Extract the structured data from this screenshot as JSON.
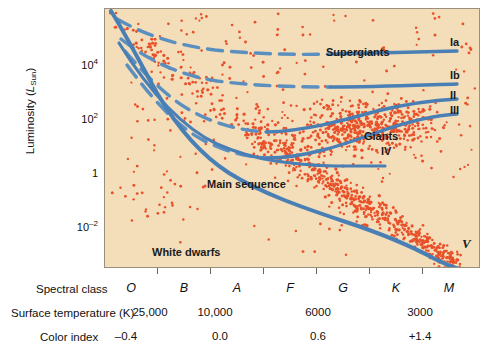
{
  "figure": {
    "type": "hr-diagram",
    "background_color": "#ffffff",
    "plot_background_color": "#f4ddb9",
    "curve_color": "#4a7fb5",
    "star_point_color": "#e8512a"
  },
  "axes": {
    "y": {
      "title_text": "Luminosity (",
      "title_symbol": "L",
      "title_subscript": "Sun",
      "title_close": ")",
      "ticks": [
        {
          "label_mantissa": "10",
          "label_exponent": "4",
          "y_px": 66
        },
        {
          "label_mantissa": "10",
          "label_exponent": "2",
          "y_px": 120
        },
        {
          "label_mantissa": "1",
          "label_exponent": "",
          "y_px": 174
        },
        {
          "label_mantissa": "10",
          "label_exponent": "–2",
          "y_px": 228
        }
      ]
    },
    "x": {
      "rows": [
        {
          "caption": "Spectral class",
          "style": "spectral",
          "values": [
            {
              "text": "O",
              "x_px": 131
            },
            {
              "text": "B",
              "x_px": 184
            },
            {
              "text": "A",
              "x_px": 237
            },
            {
              "text": "F",
              "x_px": 290
            },
            {
              "text": "G",
              "x_px": 343
            },
            {
              "text": "K",
              "x_px": 396
            },
            {
              "text": "M",
              "x_px": 449
            }
          ]
        },
        {
          "caption": "Surface temperature (K)",
          "style": "num",
          "values": [
            {
              "text": "25,000",
              "x_px": 150
            },
            {
              "text": "10,000",
              "x_px": 215
            },
            {
              "text": "6000",
              "x_px": 318
            },
            {
              "text": "3000",
              "x_px": 420
            }
          ]
        },
        {
          "caption": "Color index",
          "style": "num",
          "values": [
            {
              "text": "–0.4",
              "x_px": 126
            },
            {
              "text": "0.0",
              "x_px": 220
            },
            {
              "text": "0.6",
              "x_px": 318
            },
            {
              "text": "+1.4",
              "x_px": 420
            }
          ]
        }
      ],
      "tick_x_px": [
        157,
        210,
        263,
        316,
        369,
        422
      ]
    }
  },
  "annotations": {
    "regions": [
      {
        "text": "Supergiants",
        "x_px": 325,
        "y_px": 46
      },
      {
        "text": "Giants",
        "x_px": 363,
        "y_px": 130
      },
      {
        "text": "Main sequence",
        "x_px": 206,
        "y_px": 178
      },
      {
        "text": "White dwarfs",
        "x_px": 151,
        "y_px": 246
      }
    ],
    "luminosity_classes": [
      {
        "text": "Ia",
        "x_px": 449,
        "y_px": 36
      },
      {
        "text": "Ib",
        "x_px": 449,
        "y_px": 69
      },
      {
        "text": "II",
        "x_px": 449,
        "y_px": 89
      },
      {
        "text": "III",
        "x_px": 449,
        "y_px": 104
      },
      {
        "text": "IV",
        "x_px": 380,
        "y_px": 145
      },
      {
        "text": "V",
        "x_px": 462,
        "y_px": 237
      }
    ]
  },
  "chart_data": {
    "type": "scatter",
    "title": "",
    "xlabel": "Spectral class / Surface temperature (K) / Color index",
    "ylabel": "Luminosity (L_Sun)",
    "grid": false,
    "legend_position": "none",
    "x_axis": {
      "kind": "categorical-spectral",
      "categories": [
        "O",
        "B",
        "A",
        "F",
        "G",
        "K",
        "M"
      ],
      "temperature_K": [
        25000,
        10000,
        null,
        6000,
        null,
        3000,
        null
      ],
      "color_index": [
        -0.4,
        0.0,
        null,
        0.6,
        null,
        1.4,
        null
      ],
      "direction": "decreasing temperature left to right"
    },
    "y_axis": {
      "scale": "log",
      "tick_values": [
        10000,
        100,
        1,
        0.01
      ],
      "tick_labels": [
        "10^4",
        "10^2",
        "1",
        "10^-2"
      ],
      "ylim": [
        0.0005,
        500000
      ]
    },
    "series": [
      {
        "name": "Ia supergiants",
        "type": "line",
        "style": "solid-right-dashed-left",
        "points": [
          [
            0.02,
            200000
          ],
          [
            0.1,
            90000
          ],
          [
            0.22,
            60000
          ],
          [
            0.4,
            48000
          ],
          [
            0.62,
            44000
          ],
          [
            0.8,
            45000
          ],
          [
            1.0,
            47000
          ]
        ]
      },
      {
        "name": "Ib supergiants",
        "type": "line",
        "style": "solid-right-dashed-left",
        "points": [
          [
            0.05,
            90000
          ],
          [
            0.15,
            30000
          ],
          [
            0.3,
            14000
          ],
          [
            0.5,
            10500
          ],
          [
            0.7,
            10000
          ],
          [
            0.85,
            10500
          ],
          [
            1.0,
            11000
          ]
        ]
      },
      {
        "name": "II bright giants",
        "type": "line",
        "style": "solid-right-dashed-left",
        "points": [
          [
            0.08,
            40000
          ],
          [
            0.2,
            6000
          ],
          [
            0.35,
            1100
          ],
          [
            0.5,
            520
          ],
          [
            0.62,
            480
          ],
          [
            0.78,
            800
          ],
          [
            0.9,
            1400
          ],
          [
            1.0,
            1800
          ]
        ]
      },
      {
        "name": "III giants",
        "type": "line",
        "style": "solid-right-dashed-left",
        "points": [
          [
            0.1,
            20000
          ],
          [
            0.22,
            2200
          ],
          [
            0.36,
            320
          ],
          [
            0.48,
            110
          ],
          [
            0.58,
            85
          ],
          [
            0.72,
            170
          ],
          [
            0.86,
            380
          ],
          [
            1.0,
            600
          ]
        ]
      },
      {
        "name": "IV subgiants",
        "type": "line",
        "style": "solid",
        "points": [
          [
            0.06,
            30000
          ],
          [
            0.18,
            2500
          ],
          [
            0.32,
            280
          ],
          [
            0.46,
            55
          ],
          [
            0.6,
            22
          ],
          [
            0.75,
            14
          ],
          [
            0.88,
            12
          ],
          [
            1.0,
            11
          ]
        ]
      },
      {
        "name": "V main sequence",
        "type": "line",
        "style": "solid-thick",
        "points": [
          [
            0.0,
            300000
          ],
          [
            0.08,
            20000
          ],
          [
            0.18,
            1500
          ],
          [
            0.3,
            140
          ],
          [
            0.42,
            18
          ],
          [
            0.55,
            2.6
          ],
          [
            0.68,
            0.55
          ],
          [
            0.8,
            0.12
          ],
          [
            0.9,
            0.02
          ],
          [
            0.97,
            0.004
          ]
        ]
      },
      {
        "name": "stars",
        "type": "scatter",
        "point_color": "#e8512a",
        "description": "Several hundred individual stars: a dense main-sequence band running from upper-left to lower-right, a dense giant clump near K/III around luminosity 100, a sparse supergiant scatter across the top, and a sparse white-dwarf group at lower-left below luminosity 1."
      }
    ]
  }
}
